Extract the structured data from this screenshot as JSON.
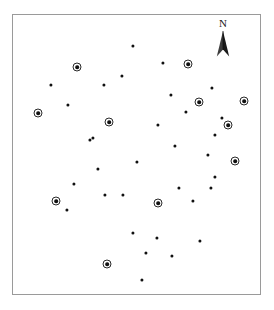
{
  "figure": {
    "name": "point-distribution-map",
    "frame": {
      "x": 12,
      "y": 14,
      "width": 249,
      "height": 281,
      "border_color": "#9a9a9a",
      "background_color": "#ffffff"
    }
  },
  "north_arrow": {
    "label": "N",
    "name": "north-arrow",
    "x": 223,
    "y": 38
  },
  "legend_colors": {
    "point_fill": "#111111",
    "ring_stroke": "#2a2a2a",
    "frame_stroke": "#9a9a9a"
  },
  "chart_data": {
    "type": "scatter",
    "title": "",
    "xlabel": "",
    "ylabel": "",
    "xlim": [
      12,
      261
    ],
    "ylim": [
      14,
      295
    ],
    "grid": false,
    "legend": "none",
    "annotations": [
      "N"
    ],
    "series": [
      {
        "name": "plain-point",
        "marker": "filled-circle",
        "count": 32,
        "points": [
          {
            "x": 133,
            "y": 46
          },
          {
            "x": 163,
            "y": 63
          },
          {
            "x": 51,
            "y": 85
          },
          {
            "x": 104,
            "y": 85
          },
          {
            "x": 122,
            "y": 76
          },
          {
            "x": 212,
            "y": 88
          },
          {
            "x": 171,
            "y": 95
          },
          {
            "x": 68,
            "y": 105
          },
          {
            "x": 158,
            "y": 125
          },
          {
            "x": 93,
            "y": 138
          },
          {
            "x": 215,
            "y": 135
          },
          {
            "x": 175,
            "y": 146
          },
          {
            "x": 208,
            "y": 155
          },
          {
            "x": 137,
            "y": 162
          },
          {
            "x": 215,
            "y": 177
          },
          {
            "x": 98,
            "y": 169
          },
          {
            "x": 74,
            "y": 184
          },
          {
            "x": 179,
            "y": 188
          },
          {
            "x": 105,
            "y": 195
          },
          {
            "x": 123,
            "y": 195
          },
          {
            "x": 193,
            "y": 201
          },
          {
            "x": 211,
            "y": 188
          },
          {
            "x": 67,
            "y": 210
          },
          {
            "x": 133,
            "y": 233
          },
          {
            "x": 157,
            "y": 238
          },
          {
            "x": 200,
            "y": 241
          },
          {
            "x": 146,
            "y": 253
          },
          {
            "x": 172,
            "y": 256
          },
          {
            "x": 142,
            "y": 280
          },
          {
            "x": 90,
            "y": 140
          },
          {
            "x": 222,
            "y": 118
          },
          {
            "x": 186,
            "y": 112
          }
        ]
      },
      {
        "name": "ringed-point",
        "marker": "filled-circle-with-ring",
        "count": 11,
        "points": [
          {
            "x": 77,
            "y": 67
          },
          {
            "x": 188,
            "y": 64
          },
          {
            "x": 38,
            "y": 113
          },
          {
            "x": 199,
            "y": 102
          },
          {
            "x": 244,
            "y": 101
          },
          {
            "x": 109,
            "y": 122
          },
          {
            "x": 235,
            "y": 161
          },
          {
            "x": 56,
            "y": 201
          },
          {
            "x": 158,
            "y": 203
          },
          {
            "x": 107,
            "y": 264
          },
          {
            "x": 228,
            "y": 125
          }
        ]
      }
    ]
  }
}
